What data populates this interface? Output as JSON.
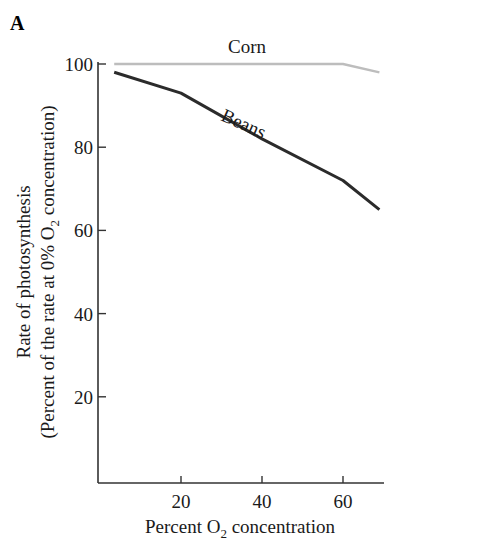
{
  "panel_label": "A",
  "chart_data": {
    "type": "line",
    "title": "",
    "xlabel": "Percent O2 concentration",
    "xlabel_parts": {
      "pre": "Percent O",
      "sub": "2",
      "post": " concentration"
    },
    "ylabel": "Rate of photosynthesis (Percent of the rate at 0% O2 concentration)",
    "ylabel_line1": "Rate of photosynthesis",
    "ylabel_line2_parts": {
      "pre": "(Percent of the rate at 0% O",
      "sub": "2",
      "post": " concentration)"
    },
    "xlim": [
      0,
      70
    ],
    "ylim": [
      0,
      100
    ],
    "xticks": [
      20,
      40,
      60
    ],
    "yticks": [
      20,
      40,
      60,
      80,
      100
    ],
    "grid": false,
    "legend": "inline labels",
    "series": [
      {
        "name": "Corn",
        "color": "#bdbdbd",
        "x": [
          3.5,
          20,
          40,
          60,
          69
        ],
        "y": [
          100,
          100,
          100,
          100,
          98
        ]
      },
      {
        "name": "Beans",
        "color": "#2b2b2b",
        "x": [
          3.5,
          20,
          40,
          60,
          69
        ],
        "y": [
          98,
          93,
          82,
          72,
          65
        ]
      }
    ]
  }
}
